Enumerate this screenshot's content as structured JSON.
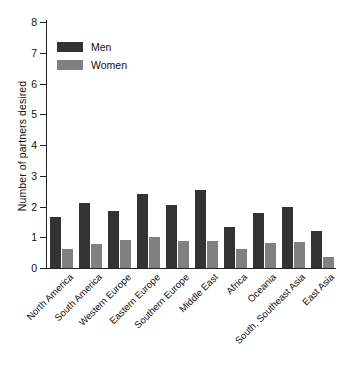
{
  "chart_data": {
    "type": "bar",
    "title": "",
    "xlabel": "",
    "ylabel": "Number of partners desired",
    "ylim": [
      0,
      8
    ],
    "yticks": [
      0,
      1,
      2,
      3,
      4,
      5,
      6,
      7,
      8
    ],
    "ytick_labels": [
      "0",
      "1",
      "2",
      "3",
      "4",
      "5",
      "6",
      "7",
      "8"
    ],
    "grid": false,
    "legend_position": "upper left",
    "categories": [
      "North America",
      "South America",
      "Western Europe",
      "Eastern Europe",
      "Southern Europe",
      "Middle East",
      "Africa",
      "Oceania",
      "South, Southeast Asia",
      "East Asia"
    ],
    "series": [
      {
        "name": "Men",
        "color": "#333333",
        "values": [
          1.67,
          2.12,
          1.85,
          2.42,
          2.04,
          2.55,
          1.34,
          1.78,
          2.0,
          1.2
        ]
      },
      {
        "name": "Women",
        "color": "#808080",
        "values": [
          0.63,
          0.78,
          0.92,
          1.0,
          0.89,
          0.87,
          0.63,
          0.8,
          0.85,
          0.35
        ]
      }
    ]
  },
  "legend": {
    "items": [
      {
        "label": "Men",
        "color": "#333333"
      },
      {
        "label": "Women",
        "color": "#808080"
      }
    ]
  },
  "axes": {
    "y_title": "Number of partners desired"
  }
}
